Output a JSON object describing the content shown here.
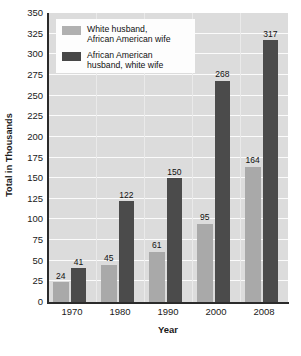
{
  "chart_data": {
    "type": "bar",
    "title": "",
    "xlabel": "Year",
    "ylabel": "Total in Thousands",
    "categories": [
      "1970",
      "1980",
      "1990",
      "2000",
      "2008"
    ],
    "series": [
      {
        "name": "White husband,\nAfrican American wife",
        "color": "#a9a9a9",
        "values": [
          24,
          45,
          61,
          95,
          164
        ]
      },
      {
        "name": "African American\nhusband, white wife",
        "color": "#4b4b4b",
        "values": [
          41,
          122,
          150,
          268,
          317
        ]
      }
    ],
    "ylim": [
      0,
      350
    ],
    "ytick_step": 25,
    "yticks": [
      "0",
      "25",
      "50",
      "75",
      "100",
      "125",
      "150",
      "175",
      "200",
      "225",
      "250",
      "275",
      "300",
      "325",
      "350"
    ],
    "grid": "horizontal-and-vertical",
    "legend_position": "top-left",
    "plot_background": "#dcdcdc",
    "gridline_color": "#fbfbfb"
  },
  "legend": {
    "items": [
      {
        "label": "White husband,\nAfrican American wife",
        "swatch": "light"
      },
      {
        "label": "African American\nhusband, white wife",
        "swatch": "dark"
      }
    ]
  },
  "axes": {
    "y_title": "Total in Thousands",
    "x_title": "Year"
  }
}
